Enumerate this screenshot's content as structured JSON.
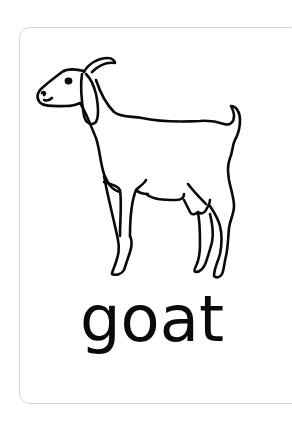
{
  "card": {
    "word": "goat",
    "illustration": "goat-icon",
    "border_color": "#d6d6d6",
    "stroke_color": "#0a0a0a",
    "background": "#ffffff"
  }
}
